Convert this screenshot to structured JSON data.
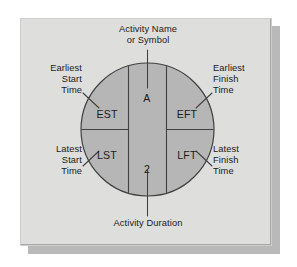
{
  "figure": {
    "shape": "circle",
    "colors": {
      "panel_background": "#dededd",
      "circle_fill": "#b6b6b6",
      "center_band_fill": "#b6b6b6",
      "line": "#404040",
      "text": "#1a1a1a",
      "shadow": "#b9b9b9"
    },
    "callouts": [
      {
        "key": "activity_name",
        "text": "Activity Name\nor Symbol",
        "align": "center",
        "position": "top"
      },
      {
        "key": "earliest_start_time",
        "text": "Earliest\nStart\nTime",
        "align": "right",
        "position": "upper-left"
      },
      {
        "key": "earliest_finish_time",
        "text": "Earliest\nFinish\nTime",
        "align": "left",
        "position": "upper-right"
      },
      {
        "key": "latest_start_time",
        "text": "Latest\nStart\nTime",
        "align": "right",
        "position": "lower-left"
      },
      {
        "key": "latest_finish_time",
        "text": "Latest\nFinish\nTime",
        "align": "left",
        "position": "lower-right"
      },
      {
        "key": "activity_duration",
        "text": "Activity Duration",
        "align": "center",
        "position": "bottom"
      }
    ],
    "cells": [
      {
        "key": "est",
        "label": "EST",
        "quadrant": "upper-left"
      },
      {
        "key": "eft",
        "label": "EFT",
        "quadrant": "upper-right"
      },
      {
        "key": "lst",
        "label": "LST",
        "quadrant": "lower-left"
      },
      {
        "key": "lft",
        "label": "LFT",
        "quadrant": "lower-right"
      },
      {
        "key": "activity_name_value",
        "label": "A",
        "quadrant": "center-top"
      },
      {
        "key": "activity_duration_value",
        "label": "2",
        "quadrant": "center-bottom"
      }
    ]
  }
}
